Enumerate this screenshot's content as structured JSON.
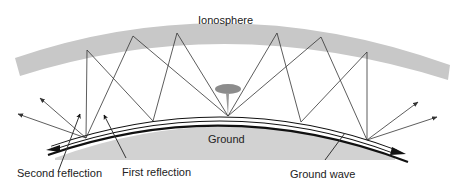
{
  "diagram": {
    "labels": {
      "ionosphere": "Ionosphere",
      "ground": "Ground",
      "second_reflection": "Second reflection",
      "first_reflection": "First reflection",
      "ground_wave": "Ground wave"
    },
    "colors": {
      "ionosphere": "#c8c8c8",
      "ground": "#cfcfcf",
      "antenna": "#8a8a8a",
      "ray": "#333333",
      "earth_line": "#111111"
    },
    "nodes": [
      {
        "id": "antenna",
        "label": "Transmitting antenna"
      },
      {
        "id": "ionosphere",
        "label": "Ionosphere"
      },
      {
        "id": "ground",
        "label": "Ground"
      }
    ],
    "edges": [
      {
        "from": "antenna",
        "to": "ionosphere",
        "label": "Sky wave"
      },
      {
        "from": "ionosphere",
        "to": "ground",
        "label": "First reflection"
      },
      {
        "from": "ground",
        "to": "ionosphere",
        "label": "Second reflection"
      },
      {
        "from": "antenna",
        "to": "ground",
        "label": "Ground wave"
      }
    ]
  }
}
